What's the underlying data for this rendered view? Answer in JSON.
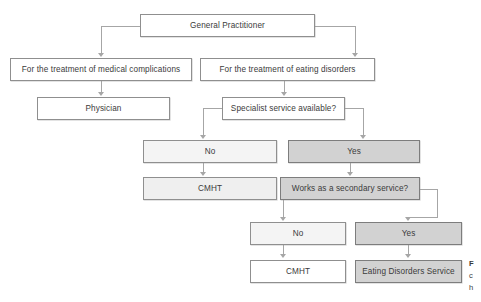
{
  "figure": {
    "colors": {
      "node_border": "#8f8f8f",
      "node_border_dark": "#7d7d7d",
      "connector": "#a6a6a6",
      "fill_white": "#ffffff",
      "fill_faint": "#f4f4f4",
      "fill_light": "#efefef",
      "fill_gray": "#d2d2d2",
      "text": "#3b3b3b",
      "background": "#ffffff"
    }
  },
  "nodes": {
    "general_practitioner": "General Practitioner",
    "medical_complications": "For the treatment of medical complications",
    "eating_disorders": "For the treatment of eating disorders",
    "physician": "Physician",
    "specialist_service_available": "Specialist service available?",
    "specialist_no": "No",
    "specialist_yes": "Yes",
    "cmht_level1": "CMHT",
    "secondary_service": "Works as a secondary service?",
    "secondary_no": "No",
    "secondary_yes": "Yes",
    "cmht_level2": "CMHT",
    "eating_disorders_service": "Eating Disorders Service"
  },
  "caption": {
    "line1_bold": "F",
    "line2": "c",
    "line3": "h"
  }
}
